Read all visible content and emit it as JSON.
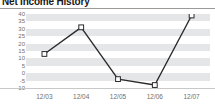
{
  "widget": {
    "title": "Net Income History",
    "title_truncated": true
  },
  "chart_data": {
    "type": "line",
    "title": "Net Income History",
    "xlabel": "",
    "ylabel": "",
    "categories": [
      "12/03",
      "12/04",
      "12/05",
      "12/06",
      "12/07"
    ],
    "values": [
      13,
      31,
      -4,
      -8,
      39
    ],
    "series": [
      {
        "name": "Net Income",
        "values": [
          13,
          31,
          -4,
          -8,
          39
        ]
      }
    ],
    "ylim": [
      -10,
      40
    ],
    "ytick_step": 5,
    "ytick_labels": [
      "40",
      "35",
      "30",
      "25",
      "20",
      "15",
      "10",
      "5",
      "0",
      "-5",
      "-10"
    ],
    "ytick_values": [
      40,
      35,
      30,
      25,
      20,
      15,
      10,
      5,
      0,
      -5,
      -10
    ],
    "grid": "horizontal-bands",
    "legend": "none",
    "marker": "open-square",
    "line_color": "#2b2b2b",
    "marker_fill": "#ffffff",
    "marker_stroke": "#2b2b2b",
    "band_color": "#e4e6e8",
    "plot_bg": "#ffffff"
  }
}
